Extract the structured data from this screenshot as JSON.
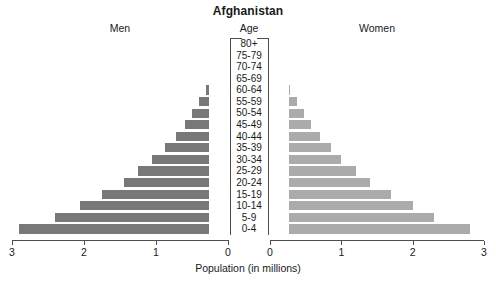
{
  "chart_data": {
    "type": "bar",
    "subtype": "population-pyramid",
    "title": "Afghanistan",
    "xlabel": "Population (in millions)",
    "ylabel": "Age",
    "left_label": "Men",
    "right_label": "Women",
    "categories": [
      "80+",
      "75-79",
      "70-74",
      "65-69",
      "60-64",
      "55-59",
      "50-54",
      "45-49",
      "40-44",
      "35-39",
      "30-34",
      "25-29",
      "20-24",
      "15-19",
      "10-14",
      "5-9",
      "0-4"
    ],
    "series": [
      {
        "name": "Men",
        "values": [
          0.05,
          0.09,
          0.15,
          0.22,
          0.3,
          0.4,
          0.5,
          0.6,
          0.72,
          0.88,
          1.05,
          1.25,
          1.45,
          1.75,
          2.05,
          2.4,
          2.9
        ]
      },
      {
        "name": "Women",
        "values": [
          0.05,
          0.07,
          0.13,
          0.2,
          0.28,
          0.38,
          0.48,
          0.58,
          0.7,
          0.85,
          1.0,
          1.2,
          1.4,
          1.7,
          2.0,
          2.3,
          2.8
        ]
      }
    ],
    "xlim": [
      0,
      3
    ],
    "x_ticks_left": [
      "3",
      "2",
      "1",
      "0"
    ],
    "x_ticks_right": [
      "0",
      "1",
      "2",
      "3"
    ],
    "tick_values": [
      0,
      1,
      2,
      3
    ],
    "grid": false,
    "legend": "none",
    "colors": {
      "men_bar": "#787878",
      "women_bar": "#ababab",
      "axis": "#4d4d4d",
      "text": "#1a1a1a",
      "background": "#ffffff"
    }
  }
}
